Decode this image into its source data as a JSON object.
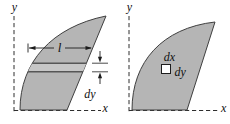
{
  "colors": {
    "background": "#ffffff",
    "region_fill": "#b5b5b5",
    "strip_band": "#c6c6c6",
    "outline": "#3f3f3f",
    "strip_line": "#565656",
    "axis": "#2e2e2e",
    "label": "#101010"
  },
  "left_figure": {
    "y_axis_label": "y",
    "x_axis_label": "x",
    "strip_length_label": "l",
    "strip_thickness_label": "dy"
  },
  "right_figure": {
    "y_axis_label": "y",
    "x_axis_label": "x",
    "element_width_label": "dx",
    "element_height_label": "dy"
  }
}
